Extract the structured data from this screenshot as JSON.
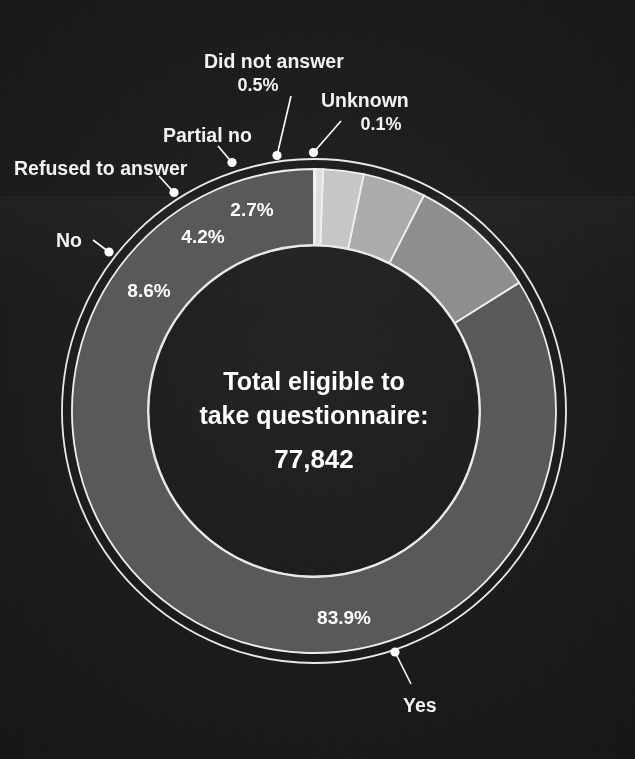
{
  "figure": {
    "background_color": "#1b1b1b",
    "text_color": "#ffffff",
    "center": {
      "line1": "Total eligible to",
      "line2": "take questionnaire:",
      "value": "77,842"
    }
  },
  "chart_data": {
    "type": "pie",
    "title": "",
    "subtitle": "",
    "xlabel": "",
    "ylabel": "",
    "legend_position": "callout-labels",
    "grid": false,
    "donut": true,
    "inner_radius_ratio": 0.686,
    "start_angle_deg": 90,
    "direction": "counterclockwise",
    "total_label": "Total eligible to take questionnaire:",
    "total_value": "77,842",
    "total_value_numeric": 77842,
    "units": "percent",
    "categories": [
      "Yes",
      "No",
      "Refused to answer",
      "Partial no",
      "Did not answer",
      "Unknown"
    ],
    "values": [
      83.9,
      8.6,
      4.2,
      2.7,
      0.5,
      0.1
    ],
    "value_labels": [
      "83.9%",
      "8.6%",
      "4.2%",
      "2.7%",
      "0.5%",
      "0.1%"
    ],
    "colors": [
      "#585858",
      "#8d8d8d",
      "#ababab",
      "#c6c6c6",
      "#dddddd",
      "#ebebeb"
    ],
    "slices": [
      {
        "name": "Yes",
        "value": 83.9,
        "label": "83.9%",
        "color": "#585858",
        "label_inside": true,
        "callout": true,
        "callout_pct_shown": false
      },
      {
        "name": "No",
        "value": 8.6,
        "label": "8.6%",
        "color": "#8d8d8d",
        "label_inside": true,
        "callout": true,
        "callout_pct_shown": false
      },
      {
        "name": "Refused to answer",
        "value": 4.2,
        "label": "4.2%",
        "color": "#ababab",
        "label_inside": true,
        "callout": true,
        "callout_pct_shown": false
      },
      {
        "name": "Partial no",
        "value": 2.7,
        "label": "2.7%",
        "color": "#c6c6c6",
        "label_inside": true,
        "callout": true,
        "callout_pct_shown": false
      },
      {
        "name": "Did not answer",
        "value": 0.5,
        "label": "0.5%",
        "color": "#dddddd",
        "label_inside": false,
        "callout": true,
        "callout_pct_shown": true
      },
      {
        "name": "Unknown",
        "value": 0.1,
        "label": "0.1%",
        "color": "#ebebeb",
        "label_inside": false,
        "callout": true,
        "callout_pct_shown": true
      }
    ]
  },
  "callouts": {
    "yes": "Yes",
    "no": "No",
    "refused": "Refused to answer",
    "partial_no": "Partial no",
    "did_not_answer": "Did not answer",
    "did_not_answer_pct": "0.5%",
    "unknown": "Unknown",
    "unknown_pct": "0.1%"
  },
  "inner_labels": {
    "yes_pct": "83.9%",
    "no_pct": "8.6%",
    "refused_pct": "4.2%",
    "partial_no_pct": "2.7%"
  }
}
